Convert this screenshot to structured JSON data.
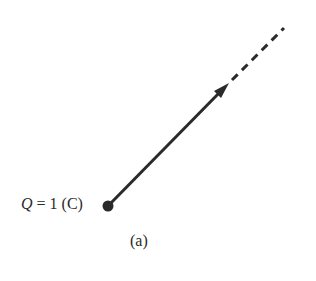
{
  "diagram": {
    "charge": {
      "symbol": "Q",
      "equals": " = 1 (C)",
      "position": {
        "x": 108,
        "y": 206
      }
    },
    "caption": "(a)",
    "field_line": {
      "solid_from": {
        "x": 108,
        "y": 206
      },
      "solid_to": {
        "x": 226,
        "y": 86
      },
      "dashed_to": {
        "x": 284,
        "y": 28
      },
      "color": "#2a2a2a"
    }
  }
}
